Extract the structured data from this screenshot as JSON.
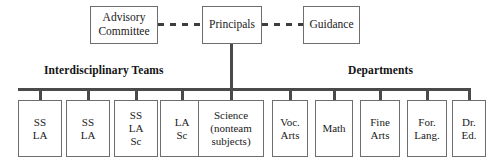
{
  "diagram": {
    "background_color": "#ffffff",
    "line_color": "#4a4a4a",
    "box_border_color": "#6e6e6e",
    "text_color": "#1a1a1a"
  },
  "top_row": {
    "advisory": {
      "label": "Advisory\nCommittee"
    },
    "principals": {
      "label": "Principals"
    },
    "guidance": {
      "label": "Guidance"
    }
  },
  "headings": {
    "left": "Interdisciplinary Teams",
    "right": "Departments"
  },
  "leaves": [
    {
      "label": "SS\nLA"
    },
    {
      "label": "SS\nLA"
    },
    {
      "label": "SS\nLA\nSc"
    },
    {
      "label": "LA\nSc"
    },
    {
      "label": "Science\n(nonteam\nsubjects)"
    },
    {
      "label": "Voc.\nArts"
    },
    {
      "label": "Math"
    },
    {
      "label": "Fine\nArts"
    },
    {
      "label": "For.\nLang."
    },
    {
      "label": "Dr.\nEd."
    }
  ]
}
